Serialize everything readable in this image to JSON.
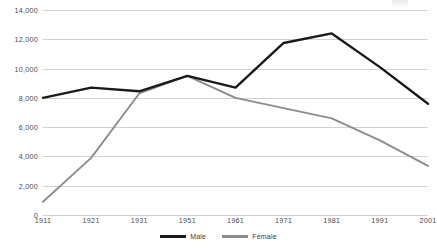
{
  "chart_data": {
    "type": "line",
    "title": "",
    "subtitle": "",
    "xlabel": "",
    "ylabel": "",
    "categories": [
      "1911",
      "1921",
      "1931",
      "1951",
      "1961",
      "1971",
      "1981",
      "1991",
      "2001"
    ],
    "ylim": [
      0,
      14000
    ],
    "ytick_labels": [
      "0",
      "2,000",
      "4,000",
      "6,000",
      "8,000",
      "10,000",
      "12,000",
      "14,000"
    ],
    "ytick_values": [
      0,
      2000,
      4000,
      6000,
      8000,
      10000,
      12000,
      14000
    ],
    "grid": "horizontal",
    "legend_position": "bottom-center",
    "series": [
      {
        "name": "Male",
        "color": "#1a1a1a",
        "values": [
          8000,
          8700,
          8450,
          9500,
          8700,
          11750,
          12400,
          10100,
          7600
        ]
      },
      {
        "name": "Female",
        "color": "#8c8c8c",
        "values": [
          900,
          3900,
          8300,
          9500,
          8000,
          7300,
          6600,
          5100,
          3350
        ]
      }
    ]
  },
  "legend": {
    "entries": [
      {
        "label": "Male"
      },
      {
        "label": "Female"
      }
    ]
  },
  "colors": {
    "male_line": "#1a1a1a",
    "female_line": "#8c8c8c",
    "gridline": "#d2d2d2",
    "axis_text": "#4a4a4a",
    "background": "#ffffff"
  }
}
